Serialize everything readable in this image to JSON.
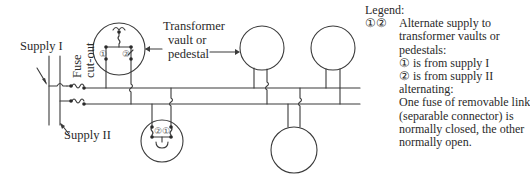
{
  "labels": {
    "supply_1": "Supply I",
    "supply_2": "Supply II",
    "fuse_line1": "Fuse",
    "fuse_line2": "cut-out",
    "transformer_line1": "Transformer",
    "transformer_line2": "vault or",
    "transformer_line3": "pedestal"
  },
  "symbols": {
    "one": "①",
    "two": "②"
  },
  "legend": {
    "title": "Legend:",
    "key": "①②",
    "lines": [
      "Alternate supply to",
      "transformer vaults or",
      "pedestals:",
      "① is from supply I",
      "② is from supply II",
      "alternating:",
      "One fuse of removable link",
      "(separable connector) is",
      "normally closed, the other",
      "normally open."
    ]
  },
  "colors": {
    "line": "#3a3a3a",
    "text": "#2a2a2a",
    "background": "#ffffff"
  }
}
